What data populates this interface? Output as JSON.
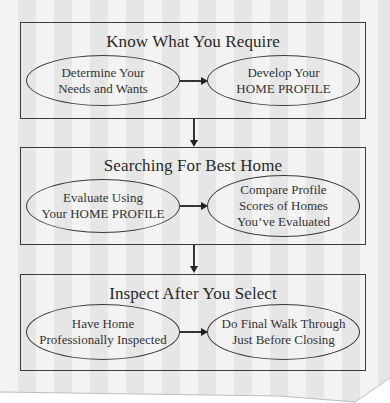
{
  "colors": {
    "stripe_light": "#f3f3f3",
    "stripe_dark": "#e4e4e4",
    "line": "#333333",
    "text": "#2e2e2e"
  },
  "stages": [
    {
      "title": "Know What You Require",
      "steps": [
        {
          "lines": [
            "Determine Your",
            "Needs and Wants"
          ]
        },
        {
          "lines": [
            "Develop Your",
            "HOME PROFILE"
          ]
        }
      ]
    },
    {
      "title": "Searching For Best Home",
      "steps": [
        {
          "lines": [
            "Evaluate Using",
            "Your HOME PROFILE"
          ]
        },
        {
          "lines": [
            "Compare Profile",
            "Scores of Homes",
            "You’ve Evaluated"
          ]
        }
      ]
    },
    {
      "title": "Inspect After You Select",
      "steps": [
        {
          "lines": [
            "Have Home",
            "Professionally Inspected"
          ]
        },
        {
          "lines": [
            "Do Final Walk Through",
            "Just Before Closing"
          ]
        }
      ]
    }
  ]
}
